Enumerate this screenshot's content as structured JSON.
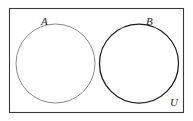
{
  "figure": {
    "kind": "venn-diagram",
    "background_color": "#ffffff"
  },
  "universe": {
    "label": "U",
    "border_color": "#3a3a3a",
    "fill_color": "#ffffff"
  },
  "sets": [
    {
      "id": "A",
      "label": "A",
      "stroke_color": "#8a8a8a",
      "fill_color": "none"
    },
    {
      "id": "B",
      "label": "B",
      "stroke_color": "#1a1a1a",
      "fill_color": "none"
    }
  ]
}
